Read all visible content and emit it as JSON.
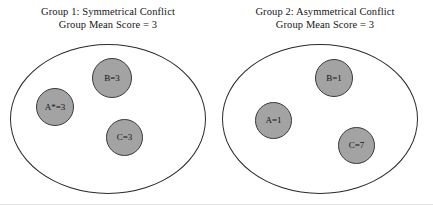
{
  "figure": {
    "bottom_rule_color": "#e4e4e4",
    "node_fill_color": "#a3a3a3",
    "node_stroke_color": "#3a3a3a",
    "ellipse_stroke_color": "#2b2b2b"
  },
  "groups": [
    {
      "title_line1": "Group 1: Symmetrical Conflict",
      "title_line2": "Group Mean Score = 3",
      "nodes": [
        {
          "label": "A*=3",
          "name": "A",
          "value": 3,
          "starred": true
        },
        {
          "label": "B=3",
          "name": "B",
          "value": 3,
          "starred": false
        },
        {
          "label": "C=3",
          "name": "C",
          "value": 3,
          "starred": false
        }
      ]
    },
    {
      "title_line1": "Group 2: Asymmetrical Conflict",
      "title_line2": "Group Mean Score = 3",
      "nodes": [
        {
          "label": "A=1",
          "name": "A",
          "value": 1,
          "starred": false
        },
        {
          "label": "B=1",
          "name": "B",
          "value": 1,
          "starred": false
        },
        {
          "label": "C=7",
          "name": "C",
          "value": 7,
          "starred": false
        }
      ]
    }
  ],
  "chart_data": {
    "type": "diagram",
    "title": "",
    "series": [
      {
        "name": "Group 1: Symmetrical Conflict",
        "categories": [
          "A*",
          "B",
          "C"
        ],
        "values": [
          3,
          3,
          3
        ],
        "mean": 3
      },
      {
        "name": "Group 2: Asymmetrical Conflict",
        "categories": [
          "A",
          "B",
          "C"
        ],
        "values": [
          1,
          1,
          7
        ],
        "mean": 3
      }
    ]
  }
}
